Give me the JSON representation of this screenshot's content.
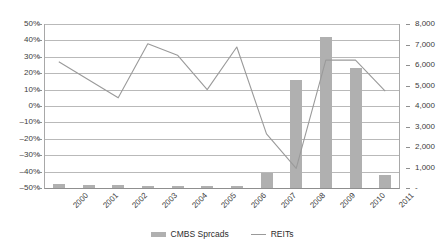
{
  "chart_data": {
    "type": "bar",
    "title": "",
    "subtitle": "",
    "xlabel": "",
    "ylabel": "",
    "grid": true,
    "legend_position": "bottom-center",
    "categories": [
      "2000",
      "2001",
      "2002",
      "2003",
      "2004",
      "2005",
      "2006",
      "2007",
      "2008",
      "2009",
      "2010",
      "2011"
    ],
    "series": [
      {
        "name": "CMBS Sprcads",
        "type": "bar",
        "axis": "right",
        "color": "#b0b0b0",
        "values": [
          250,
          200,
          180,
          140,
          130,
          160,
          170,
          800,
          5300,
          7400,
          5900,
          700
        ]
      },
      {
        "name": "REITs",
        "type": "line",
        "axis": "left",
        "color": "#9a9a9a",
        "values": [
          27,
          16,
          5,
          38,
          31,
          10,
          36,
          -17,
          -38,
          28,
          28,
          9
        ]
      }
    ],
    "left_axis": {
      "label": "",
      "min": -50,
      "max": 50,
      "step": 10,
      "ticks": [
        "50%",
        "40%",
        "30%",
        "20%",
        "10%",
        "0%",
        "–10%",
        "–20%",
        "–30%",
        "–40%",
        "–50%"
      ]
    },
    "right_axis": {
      "label": "",
      "min": 0,
      "max": 8000,
      "step": 1000,
      "ticks": [
        "8,000",
        "7,000",
        "6,000",
        "5,000",
        "4,000",
        "3,000",
        "2,000",
        "1,000",
        "-"
      ]
    }
  },
  "legend": {
    "items": [
      {
        "label": "CMBS Sprcads",
        "marker": "bar-swatch-icon"
      },
      {
        "label": "REITs",
        "marker": "line-swatch-icon"
      }
    ]
  },
  "colors": {
    "bar": "#b0b0b0",
    "line": "#9a9a9a",
    "grid": "#b9b9b9",
    "axis": "#8f8f8f",
    "text": "#3c3c3c"
  }
}
